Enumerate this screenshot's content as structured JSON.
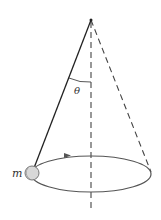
{
  "diagram": {
    "labels": {
      "angle": "θ",
      "mass": "m"
    },
    "elements": {
      "string": "solid line from pivot to mass",
      "axis": "vertical dashed line through pivot",
      "cone_edge": "dashed line from pivot to far side of orbit",
      "orbit": "horizontal circular path (drawn as ellipse)",
      "direction": "arrow on orbit indicating motion"
    },
    "colors": {
      "line": "#333333",
      "orbit": "#555555",
      "mass_fill": "#d8d8d8",
      "mass_stroke": "#777777"
    }
  }
}
